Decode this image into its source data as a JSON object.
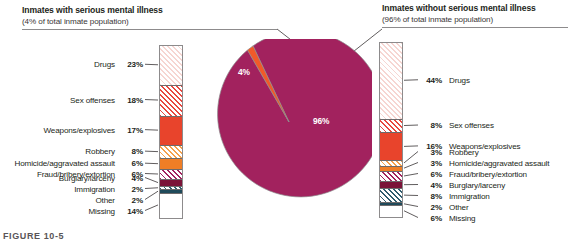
{
  "figure": {
    "caption": "FIGURE 10-5"
  },
  "left_panel": {
    "title": "Inmates with serious mental illness",
    "subtitle": "(4% of total inmate population)"
  },
  "right_panel": {
    "title": "Inmates without serious mental illness",
    "subtitle": "(96% of total inmate population)"
  },
  "pie": {
    "slice_major_label": "96%",
    "slice_minor_label": "4%",
    "color_major": "#a2225e",
    "color_minor": "#f15a29"
  },
  "chart_data": [
    {
      "type": "pie",
      "title": "Share of total inmate population",
      "categories": [
        "Inmates without serious mental illness",
        "Inmates with serious mental illness"
      ],
      "values": [
        96,
        4
      ],
      "labels": [
        "96%",
        "4%"
      ],
      "colors": [
        "#a2225e",
        "#f15a29"
      ],
      "legend": "none"
    },
    {
      "type": "bar",
      "orientation": "stacked-vertical",
      "title": "Inmates with serious mental illness",
      "subtitle": "(4% of total inmate population)",
      "xlabel": "",
      "ylabel": "Percent of offenses",
      "ylim": [
        0,
        100
      ],
      "grid": false,
      "legend": "leader-labels-left",
      "categories": [
        "Drugs",
        "Sex offenses",
        "Weapons/explosives",
        "Robbery",
        "Homicide/aggravated assault",
        "Fraud/bribery/extortion",
        "Burglary/larceny",
        "Immigration",
        "Other",
        "Missing"
      ],
      "values": [
        23,
        18,
        17,
        8,
        6,
        6,
        4,
        2,
        2,
        14
      ],
      "value_labels": [
        "23%",
        "18%",
        "17%",
        "8%",
        "6%",
        "6%",
        "4%",
        "2%",
        "2%",
        "14%"
      ],
      "colors": [
        "#f6d6d2",
        "#e8473f",
        "#e8442c",
        "#f5a04b",
        "#ef7e26",
        "#a2225e",
        "#7b1338",
        "#2e5c6e",
        "#1f4a5a",
        "#ffffff"
      ],
      "hatch": [
        true,
        true,
        false,
        true,
        false,
        true,
        false,
        true,
        false,
        false
      ]
    },
    {
      "type": "bar",
      "orientation": "stacked-vertical",
      "title": "Inmates without serious mental illness",
      "subtitle": "(96% of total inmate population)",
      "xlabel": "",
      "ylabel": "Percent of offenses",
      "ylim": [
        0,
        100
      ],
      "grid": false,
      "legend": "leader-labels-right",
      "categories": [
        "Drugs",
        "Sex offenses",
        "Weapons/explosives",
        "Robbery",
        "Homicide/aggravated assault",
        "Fraud/bribery/extortion",
        "Burglary/larceny",
        "Immigration",
        "Other",
        "Missing"
      ],
      "values": [
        44,
        8,
        16,
        3,
        3,
        6,
        4,
        8,
        2,
        6
      ],
      "value_labels": [
        "44%",
        "8%",
        "16%",
        "3%",
        "3%",
        "6%",
        "4%",
        "8%",
        "2%",
        "6%"
      ],
      "colors": [
        "#f6d6d2",
        "#e8473f",
        "#e8442c",
        "#f5a04b",
        "#ef7e26",
        "#a2225e",
        "#7b1338",
        "#2e5c6e",
        "#1f4a5a",
        "#ffffff"
      ],
      "hatch": [
        true,
        true,
        false,
        true,
        false,
        true,
        false,
        true,
        false,
        false
      ]
    }
  ],
  "left_labels": [
    {
      "name": "Drugs",
      "pct": "23%"
    },
    {
      "name": "Sex offenses",
      "pct": "18%"
    },
    {
      "name": "Weapons/explosives",
      "pct": "17%"
    },
    {
      "name": "Robbery",
      "pct": "8%"
    },
    {
      "name": "Homicide/aggravated assault",
      "pct": "6%"
    },
    {
      "name": "Fraud/bribery/extortion",
      "pct": "6%"
    },
    {
      "name": "Burglary/larceny",
      "pct": "4%"
    },
    {
      "name": "Immigration",
      "pct": "2%"
    },
    {
      "name": "Other",
      "pct": "2%"
    },
    {
      "name": "Missing",
      "pct": "14%"
    }
  ],
  "right_labels": [
    {
      "pct": "44%",
      "name": "Drugs"
    },
    {
      "pct": "8%",
      "name": "Sex offenses"
    },
    {
      "pct": "16%",
      "name": "Weapons/explosives"
    },
    {
      "pct": "3%",
      "name": "Robbery"
    },
    {
      "pct": "3%",
      "name": "Homicide/aggravated assault"
    },
    {
      "pct": "6%",
      "name": "Fraud/bribery/extortion"
    },
    {
      "pct": "4%",
      "name": "Burglary/larceny"
    },
    {
      "pct": "8%",
      "name": "Immigration"
    },
    {
      "pct": "2%",
      "name": "Other"
    },
    {
      "pct": "6%",
      "name": "Missing"
    }
  ]
}
